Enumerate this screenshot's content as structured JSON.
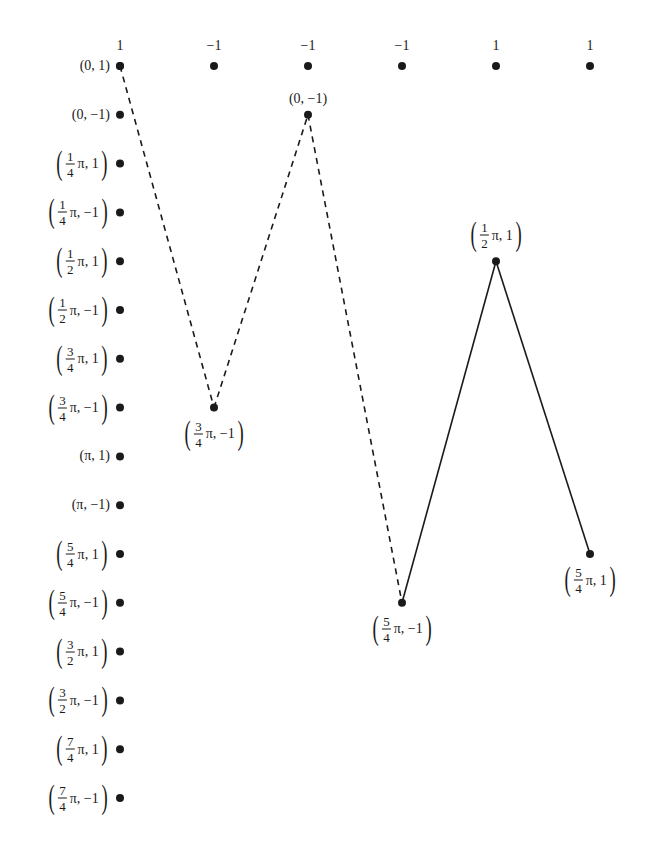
{
  "layout": {
    "column_x": [
      120,
      214,
      308,
      402,
      496,
      590
    ],
    "row_y0": 66,
    "row_step": 48.8
  },
  "column_headers": [
    "1",
    "−1",
    "−1",
    "−1",
    "1",
    "1"
  ],
  "row_labels": [
    {
      "num": "",
      "den": "",
      "plain": "(0, 1)",
      "rest": ""
    },
    {
      "num": "",
      "den": "",
      "plain": "(0, −1)",
      "rest": ""
    },
    {
      "num": "1",
      "den": "4",
      "plain": "",
      "rest": "π, 1"
    },
    {
      "num": "1",
      "den": "4",
      "plain": "",
      "rest": "π, −1"
    },
    {
      "num": "1",
      "den": "2",
      "plain": "",
      "rest": "π, 1"
    },
    {
      "num": "1",
      "den": "2",
      "plain": "",
      "rest": "π, −1"
    },
    {
      "num": "3",
      "den": "4",
      "plain": "",
      "rest": "π, 1"
    },
    {
      "num": "3",
      "den": "4",
      "plain": "",
      "rest": "π, −1"
    },
    {
      "num": "",
      "den": "",
      "plain": "(π, 1)",
      "rest": ""
    },
    {
      "num": "",
      "den": "",
      "plain": "(π, −1)",
      "rest": ""
    },
    {
      "num": "5",
      "den": "4",
      "plain": "",
      "rest": "π, 1"
    },
    {
      "num": "5",
      "den": "4",
      "plain": "",
      "rest": "π, −1"
    },
    {
      "num": "3",
      "den": "2",
      "plain": "",
      "rest": "π, 1"
    },
    {
      "num": "3",
      "den": "2",
      "plain": "",
      "rest": "π, −1"
    },
    {
      "num": "7",
      "den": "4",
      "plain": "",
      "rest": "π, 1"
    },
    {
      "num": "7",
      "den": "4",
      "plain": "",
      "rest": "π, −1"
    }
  ],
  "path_points": [
    {
      "col": 0,
      "row": 0,
      "label": null,
      "label_pos": null
    },
    {
      "col": 1,
      "row": 7,
      "label": {
        "num": "3",
        "den": "4",
        "rest": "π, −1"
      },
      "label_pos": "below"
    },
    {
      "col": 2,
      "row": 1,
      "label": {
        "plain": "(0, −1)"
      },
      "label_pos": "above"
    },
    {
      "col": 3,
      "row": 11,
      "label": {
        "num": "5",
        "den": "4",
        "rest": "π, −1"
      },
      "label_pos": "below"
    },
    {
      "col": 4,
      "row": 4,
      "label": {
        "num": "1",
        "den": "2",
        "rest": "π, 1"
      },
      "label_pos": "above"
    },
    {
      "col": 5,
      "row": 10,
      "label": {
        "num": "5",
        "den": "4",
        "rest": "π, 1"
      },
      "label_pos": "below"
    }
  ],
  "segments": [
    {
      "from": 0,
      "to": 1,
      "style": "dashed"
    },
    {
      "from": 1,
      "to": 2,
      "style": "dashed"
    },
    {
      "from": 2,
      "to": 3,
      "style": "dashed"
    },
    {
      "from": 3,
      "to": 4,
      "style": "solid"
    },
    {
      "from": 4,
      "to": 5,
      "style": "solid"
    }
  ],
  "colors": {
    "ink": "#1a1a1a",
    "background": "#ffffff"
  }
}
